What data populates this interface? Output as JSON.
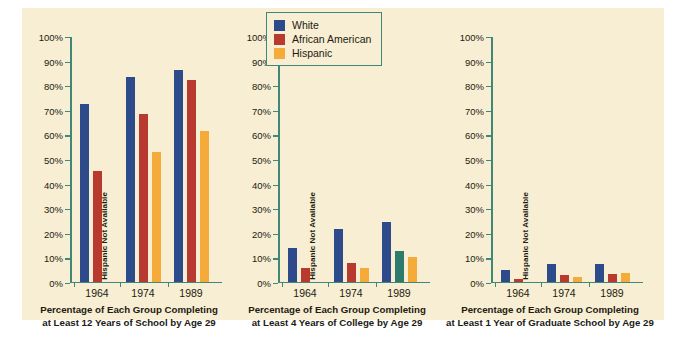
{
  "legend": {
    "entries": [
      {
        "label": "White",
        "color": "#2d4a8a"
      },
      {
        "label": "African American",
        "color": "#b83a2e"
      },
      {
        "label": "Hispanic",
        "color": "#f5ab3a"
      }
    ]
  },
  "palette": {
    "white_group": "#2d4a8a",
    "african_american_group": "#b83a2e",
    "hispanic_group": "#f5ab3a",
    "anomalous_teal": "#2e7a6b",
    "axis": "#3f8878",
    "panel_background": "#f7eed3",
    "text": "#231a10"
  },
  "axis": {
    "ticks": [
      "100%",
      "90%",
      "80%",
      "70%",
      "60%",
      "50%",
      "40%",
      "30%",
      "20%",
      "10%",
      "0%"
    ],
    "na_note": "Hispanic Not Available"
  },
  "chart_data": [
    {
      "type": "bar",
      "title": "Percentage of Each Group Completing at Least 12 Years of School by Age 29",
      "caption_line1": "Percentage of Each Group Completing",
      "caption_line2": "at Least 12 Years of School by Age 29",
      "categories": [
        "1964",
        "1974",
        "1989"
      ],
      "xlabel": "",
      "ylabel": "",
      "ylim": [
        0,
        100
      ],
      "grid": false,
      "legend_position": "top-center",
      "series": [
        {
          "name": "White",
          "color": "#2d4a8a",
          "values": [
            72,
            83,
            86
          ]
        },
        {
          "name": "African American",
          "color": "#b83a2e",
          "values": [
            45,
            68,
            82
          ]
        },
        {
          "name": "Hispanic",
          "color": "#f5ab3a",
          "values": [
            null,
            52.5,
            61
          ]
        }
      ]
    },
    {
      "type": "bar",
      "title": "Percentage of Each Group Completing at Least 4 Years of College by Age 29",
      "caption_line1": "Percentage of Each Group Completing",
      "caption_line2": "at Least 4 Years of College by Age 29",
      "categories": [
        "1964",
        "1974",
        "1989"
      ],
      "xlabel": "",
      "ylabel": "",
      "ylim": [
        0,
        100
      ],
      "grid": false,
      "legend_position": "top-center",
      "series": [
        {
          "name": "White",
          "color": "#2d4a8a",
          "values": [
            13.5,
            21.5,
            24
          ]
        },
        {
          "name": "African American",
          "color": "#b83a2e",
          "values": [
            5.5,
            7.5,
            12.5
          ],
          "value_colors": [
            null,
            null,
            "#2e7a6b"
          ]
        },
        {
          "name": "Hispanic",
          "color": "#f5ab3a",
          "values": [
            null,
            5.5,
            10
          ]
        }
      ]
    },
    {
      "type": "bar",
      "title": "Percentage of Each Group Completing at Least 1 Year of Graduate School by Age 29",
      "caption_line1": "Percentage of Each Group Completing",
      "caption_line2": "at Least 1 Year of Graduate School by Age 29",
      "categories": [
        "1964",
        "1974",
        "1989"
      ],
      "xlabel": "",
      "ylabel": "",
      "ylim": [
        0,
        100
      ],
      "grid": false,
      "legend_position": "top-center",
      "series": [
        {
          "name": "White",
          "color": "#2d4a8a",
          "values": [
            4.5,
            7,
            7
          ]
        },
        {
          "name": "African American",
          "color": "#b83a2e",
          "values": [
            1,
            2.5,
            3
          ]
        },
        {
          "name": "Hispanic",
          "color": "#f5ab3a",
          "values": [
            null,
            2,
            3.5
          ]
        }
      ]
    }
  ]
}
